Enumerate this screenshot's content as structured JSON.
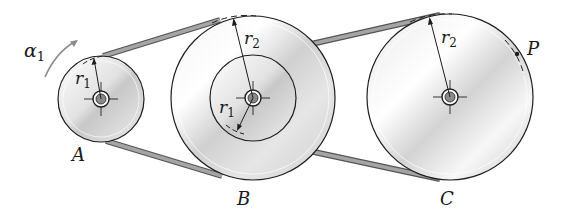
{
  "diagram": {
    "colors": {
      "outline": "#1e1e1e",
      "belt_fill": "#9a9a9a",
      "belt_edge": "#555555",
      "disk_light": "#f4f4f4",
      "disk_mid": "#d6d6d6",
      "disk_dark": "#bdbdbd",
      "arrow_gray": "#8c8c8c",
      "hub_fill": "#8a8a8a"
    },
    "pulleys": [
      {
        "id": "A",
        "label": "A",
        "cx": 101,
        "cy": 99,
        "r": 43
      },
      {
        "id": "B",
        "label": "B",
        "cx": 253,
        "cy": 98,
        "r_outer": 82,
        "r_inner": 43
      },
      {
        "id": "C",
        "label": "C",
        "cx": 450,
        "cy": 97,
        "r": 83
      }
    ],
    "labels": {
      "alpha": "α",
      "alpha_sub": "1",
      "r1": "r",
      "r1_sub": "1",
      "r2": "r",
      "r2_sub": "2",
      "point": "P",
      "A": "A",
      "B": "B",
      "C": "C"
    }
  }
}
